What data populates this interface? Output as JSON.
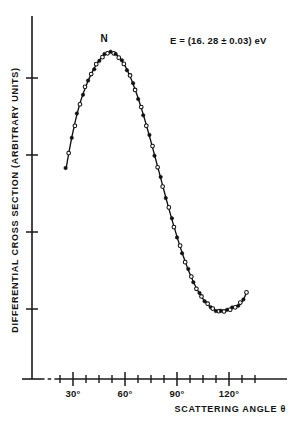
{
  "chart_data": {
    "type": "line",
    "title": "",
    "xlabel": "SCATTERING  ANGLE θ",
    "ylabel": "DIFFERENTIAL  CROSS  SECTION  (ARBITRARY UNITS)",
    "annotation": "E = (16. 28 ± 0.03) eV",
    "peak_label": "N",
    "grid": false,
    "legend": "none",
    "xlim": [
      18,
      140
    ],
    "ylim": [
      0,
      100
    ],
    "xtick_labels": [
      "30°",
      "60°",
      "90°",
      "120°"
    ],
    "xtick_values": [
      30,
      60,
      90,
      120
    ],
    "xminor_values": [
      22.5,
      37.5,
      45,
      52.5,
      67.5,
      75,
      82.5,
      97.5,
      105,
      112.5,
      127.5,
      135
    ],
    "ytick_count": 4,
    "ytick_labels": [],
    "series": [
      {
        "name": "measured differential cross section",
        "marker_styles": [
          "filled",
          "open"
        ],
        "x": [
          26.0,
          27.6,
          29.2,
          30.8,
          32.4,
          34.0,
          35.6,
          37.2,
          38.8,
          40.4,
          42.0,
          43.6,
          45.2,
          46.8,
          48.4,
          50.0,
          51.6,
          53.2,
          54.8,
          56.4,
          58.0,
          59.6,
          61.2,
          62.8,
          64.4,
          66.0,
          67.6,
          69.2,
          70.8,
          72.4,
          74.0,
          75.6,
          77.2,
          78.8,
          80.4,
          82.0,
          83.6,
          85.2,
          86.8,
          88.4,
          90.0,
          91.6,
          93.2,
          94.8,
          96.4,
          98.0,
          99.6,
          101.2,
          102.8,
          104.4,
          106.0,
          107.6,
          109.2,
          110.8,
          112.4,
          114.0,
          115.6,
          117.2,
          118.8,
          120.4,
          122.0,
          123.6,
          125.2,
          126.8,
          128.4,
          130.0
        ],
        "y": [
          58.0,
          63.5,
          68.5,
          73.0,
          77.0,
          80.5,
          83.5,
          86.0,
          88.5,
          90.5,
          92.5,
          94.0,
          95.5,
          96.5,
          97.3,
          97.9,
          98.2,
          98.0,
          97.5,
          96.6,
          95.4,
          93.9,
          92.1,
          90.0,
          87.7,
          85.1,
          82.3,
          79.3,
          76.2,
          72.9,
          69.5,
          66.0,
          62.4,
          58.8,
          55.2,
          51.6,
          48.0,
          44.5,
          41.1,
          37.8,
          34.6,
          31.5,
          28.6,
          25.9,
          23.3,
          21.0,
          18.8,
          16.9,
          15.2,
          13.7,
          12.4,
          11.3,
          10.4,
          9.7,
          9.2,
          8.9,
          8.8,
          8.9,
          9.2,
          9.6,
          10.1,
          10.5,
          10.8,
          11.6,
          13.0,
          15.2
        ]
      }
    ]
  },
  "axis": {
    "x_caption": "SCATTERING  ANGLE θ",
    "y_caption": "DIFFERENTIAL  CROSS  SECTION  (ARBITRARY UNITS)"
  },
  "labels": {
    "peak": "N",
    "energy": "E = (16. 28 ± 0.03) eV",
    "tick_30": "30°",
    "tick_60": "60°",
    "tick_90": "90°",
    "tick_120": "120°"
  },
  "colors": {
    "ink": "#111111",
    "background": "#ffffff"
  }
}
